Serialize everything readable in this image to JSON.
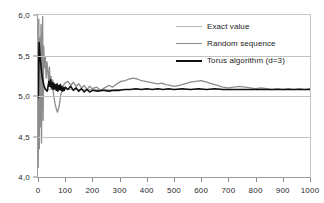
{
  "chart_data": {
    "type": "line",
    "title": "",
    "xlabel": "",
    "ylabel": "",
    "xlim": [
      0,
      1000
    ],
    "ylim": [
      4.0,
      6.0
    ],
    "grid": true,
    "legend_position": "upper-right",
    "x_ticks": [
      "0",
      "100",
      "200",
      "300",
      "400",
      "500",
      "600",
      "700",
      "800",
      "900",
      "1000"
    ],
    "x_tick_values": [
      0,
      100,
      200,
      300,
      400,
      500,
      600,
      700,
      800,
      900,
      1000
    ],
    "y_ticks": [
      "4,0",
      "4,5",
      "5,0",
      "5,5",
      "6,0"
    ],
    "y_tick_values": [
      4.0,
      4.5,
      5.0,
      5.5,
      6.0
    ],
    "colors": {
      "exact": "#b3b3b3",
      "random": "#8c8c8c",
      "torus": "#101010",
      "grid": "#c2c2c2",
      "axis": "#8a8a8a",
      "text": "#2b2b2b"
    },
    "series": [
      {
        "name": "Exact value",
        "color": "#b3b3b3",
        "width": 1.2,
        "constant": 5.08,
        "x": [
          0,
          1000
        ],
        "values": [
          5.08,
          5.08
        ]
      },
      {
        "name": "Random sequence",
        "color": "#8c8c8c",
        "width": 1.3,
        "x": [
          1,
          3,
          5,
          7,
          9,
          11,
          13,
          15,
          17,
          19,
          21,
          24,
          27,
          30,
          33,
          36,
          39,
          42,
          45,
          48,
          51,
          54,
          57,
          60,
          63,
          66,
          69,
          72,
          75,
          78,
          81,
          84,
          87,
          90,
          95,
          100,
          110,
          120,
          130,
          140,
          150,
          160,
          170,
          180,
          190,
          200,
          215,
          230,
          245,
          260,
          275,
          290,
          305,
          320,
          335,
          350,
          365,
          380,
          395,
          410,
          425,
          440,
          455,
          470,
          485,
          500,
          520,
          540,
          560,
          580,
          600,
          620,
          640,
          660,
          680,
          700,
          720,
          740,
          760,
          780,
          800,
          820,
          840,
          860,
          880,
          900,
          920,
          940,
          960,
          980,
          1000
        ],
        "values": [
          4.12,
          5.95,
          4.35,
          5.72,
          4.62,
          5.88,
          4.42,
          5.55,
          5.98,
          4.7,
          5.62,
          5.35,
          5.48,
          5.22,
          5.42,
          5.3,
          5.18,
          5.36,
          5.15,
          5.24,
          5.1,
          5.2,
          5.02,
          4.96,
          4.9,
          4.86,
          4.82,
          4.8,
          4.84,
          4.88,
          4.95,
          5.02,
          5.05,
          5.1,
          5.14,
          5.16,
          5.18,
          5.13,
          5.17,
          5.12,
          5.15,
          5.1,
          5.13,
          5.08,
          5.12,
          5.09,
          5.11,
          5.07,
          5.1,
          5.13,
          5.11,
          5.15,
          5.18,
          5.19,
          5.21,
          5.22,
          5.21,
          5.19,
          5.18,
          5.17,
          5.16,
          5.15,
          5.16,
          5.14,
          5.13,
          5.12,
          5.13,
          5.15,
          5.17,
          5.18,
          5.19,
          5.17,
          5.15,
          5.13,
          5.11,
          5.1,
          5.11,
          5.12,
          5.11,
          5.1,
          5.09,
          5.1,
          5.09,
          5.08,
          5.09,
          5.08,
          5.09,
          5.08,
          5.09,
          5.08,
          5.09
        ]
      },
      {
        "name": "Torus algorithm (d=3)",
        "color": "#101010",
        "width": 1.6,
        "x": [
          1,
          4,
          7,
          10,
          13,
          16,
          19,
          22,
          25,
          28,
          31,
          34,
          37,
          40,
          43,
          46,
          49,
          52,
          55,
          58,
          61,
          64,
          67,
          70,
          73,
          76,
          79,
          82,
          85,
          88,
          91,
          94,
          97,
          100,
          110,
          120,
          130,
          140,
          150,
          160,
          170,
          180,
          190,
          200,
          220,
          240,
          260,
          280,
          300,
          320,
          340,
          360,
          380,
          400,
          420,
          440,
          460,
          480,
          500,
          530,
          560,
          590,
          620,
          650,
          680,
          710,
          740,
          770,
          800,
          830,
          860,
          890,
          920,
          950,
          980,
          1000
        ],
        "values": [
          4.98,
          5.66,
          5.52,
          5.4,
          5.3,
          5.22,
          5.17,
          5.13,
          5.1,
          5.08,
          5.07,
          5.06,
          5.12,
          5.18,
          5.12,
          5.2,
          5.1,
          5.17,
          5.08,
          5.16,
          5.09,
          5.14,
          5.07,
          5.15,
          5.06,
          5.13,
          5.08,
          5.14,
          5.07,
          5.12,
          5.06,
          5.1,
          5.07,
          5.11,
          5.08,
          5.12,
          5.07,
          5.1,
          5.06,
          5.09,
          5.05,
          5.08,
          5.05,
          5.07,
          5.06,
          5.07,
          5.06,
          5.07,
          5.07,
          5.08,
          5.08,
          5.09,
          5.08,
          5.09,
          5.08,
          5.09,
          5.08,
          5.09,
          5.08,
          5.09,
          5.08,
          5.09,
          5.08,
          5.09,
          5.08,
          5.08,
          5.08,
          5.08,
          5.08,
          5.08,
          5.08,
          5.08,
          5.08,
          5.08,
          5.08,
          5.08
        ]
      }
    ],
    "legend": [
      {
        "label": "Exact value",
        "color": "#b3b3b3",
        "width": 1.3
      },
      {
        "label": "Random sequence",
        "color": "#8c8c8c",
        "width": 1.3
      },
      {
        "label": "Torus algorithm (d=3)",
        "color": "#101010",
        "width": 2.0
      }
    ]
  }
}
